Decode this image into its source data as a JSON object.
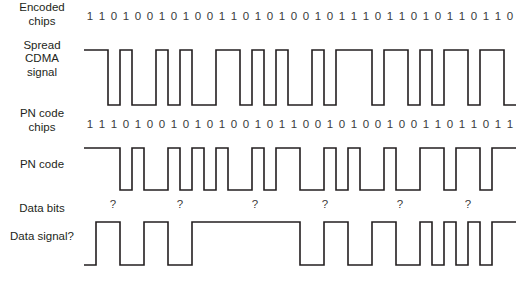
{
  "layout": {
    "chip_start_x": 84,
    "chip_width": 12,
    "chip_count": 36,
    "label_center_x": 42,
    "stroke_color": "#231f20",
    "text_color": "#3a3a3a",
    "background": "#ffffff"
  },
  "rows": [
    {
      "id": "encoded-chips",
      "label": "Encoded\nchips",
      "label_lines": [
        "Encoded",
        "chips"
      ],
      "type": "bits",
      "label_y": 18,
      "bits_y": 20,
      "bits": [
        1,
        1,
        0,
        1,
        0,
        0,
        1,
        0,
        1,
        0,
        0,
        1,
        1,
        0,
        1,
        0,
        1,
        0,
        0,
        1,
        0,
        1,
        1,
        1,
        0,
        1,
        1,
        0,
        1,
        0,
        1,
        1,
        0,
        1,
        1,
        0
      ]
    },
    {
      "id": "spread-cdma-signal",
      "label_lines": [
        "Spread",
        "CDMA",
        "signal"
      ],
      "type": "wave",
      "label_y": 62,
      "high_y": 50,
      "low_y": 105,
      "bits": [
        1,
        1,
        0,
        1,
        0,
        0,
        1,
        0,
        1,
        0,
        0,
        1,
        1,
        0,
        1,
        0,
        1,
        0,
        0,
        1,
        0,
        1,
        1,
        1,
        0,
        1,
        1,
        0,
        1,
        0,
        1,
        1,
        0,
        1,
        1,
        0
      ]
    },
    {
      "id": "pn-code-chips",
      "label_lines": [
        "PN code",
        "chips"
      ],
      "type": "bits",
      "label_y": 124,
      "bits_y": 128,
      "bits": [
        1,
        1,
        1,
        0,
        1,
        0,
        0,
        1,
        0,
        1,
        0,
        1,
        0,
        0,
        1,
        0,
        1,
        1,
        0,
        0,
        1,
        0,
        1,
        0,
        0,
        1,
        0,
        0,
        1,
        1,
        0,
        1,
        1,
        0,
        1,
        1
      ]
    },
    {
      "id": "pn-code",
      "label_lines": [
        "PN code"
      ],
      "type": "wave",
      "label_y": 168,
      "high_y": 148,
      "low_y": 190,
      "bits": [
        1,
        1,
        1,
        0,
        1,
        0,
        0,
        1,
        0,
        1,
        0,
        1,
        0,
        0,
        1,
        0,
        1,
        1,
        0,
        0,
        1,
        0,
        1,
        0,
        0,
        1,
        0,
        0,
        1,
        1,
        0,
        1,
        1,
        0,
        1,
        1
      ]
    },
    {
      "id": "data-bits",
      "label_lines": [
        "Data bits"
      ],
      "type": "marks",
      "label_y": 212,
      "marks_y": 208,
      "mark_symbol": "?",
      "mark_positions_x": [
        113,
        180,
        255,
        325,
        400,
        468
      ]
    },
    {
      "id": "data-signal",
      "label_lines": [
        "Data signal?"
      ],
      "type": "wave",
      "label_y": 240,
      "high_y": 222,
      "low_y": 265,
      "bits": [
        0,
        1,
        1,
        0,
        0,
        1,
        1,
        0,
        0,
        1,
        1,
        1,
        1,
        1,
        1,
        1,
        1,
        1,
        0,
        0,
        1,
        1,
        0,
        0,
        1,
        1,
        0,
        0,
        1,
        0,
        1,
        0,
        1,
        0,
        1,
        1
      ]
    }
  ]
}
